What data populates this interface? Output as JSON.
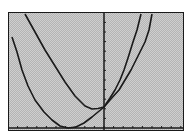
{
  "window": {
    "title": "Graph screen"
  },
  "chart_data": {
    "type": "line",
    "title": "",
    "xlabel": "",
    "ylabel": "",
    "grid": false,
    "axes": {
      "x_axis_pixel_y": 128,
      "y_axis_pixel_x": 104,
      "x_ticks_count": 18,
      "y_ticks_count": 10
    },
    "series": [
      {
        "name": "curve-1",
        "shape": "parabola opening upward (wider, higher vertex)",
        "points_px": [
          [
            25,
            14
          ],
          [
            35,
            32
          ],
          [
            45,
            50
          ],
          [
            55,
            66
          ],
          [
            65,
            82
          ],
          [
            75,
            96
          ],
          [
            85,
            106
          ],
          [
            92,
            109
          ],
          [
            98,
            108.5
          ],
          [
            104,
            107
          ],
          [
            110,
            98
          ],
          [
            115,
            90
          ],
          [
            120,
            80
          ],
          [
            124,
            70
          ],
          [
            128,
            58
          ],
          [
            133,
            42
          ],
          [
            137,
            30
          ],
          [
            141,
            14
          ]
        ]
      },
      {
        "name": "curve-2",
        "shape": "parabola opening upward (vertex on x-axis)",
        "points_px": [
          [
            12,
            37
          ],
          [
            17,
            52
          ],
          [
            22,
            70
          ],
          [
            28,
            86
          ],
          [
            35,
            100
          ],
          [
            44,
            112
          ],
          [
            52,
            120
          ],
          [
            60,
            126
          ],
          [
            68,
            128
          ],
          [
            76,
            127
          ],
          [
            84,
            123
          ],
          [
            92,
            117
          ],
          [
            98,
            112
          ],
          [
            104,
            107
          ],
          [
            110,
            100
          ],
          [
            119,
            90
          ],
          [
            125,
            80
          ],
          [
            131,
            70
          ],
          [
            137,
            58
          ],
          [
            145,
            42
          ],
          [
            149,
            30
          ],
          [
            152,
            14
          ]
        ]
      }
    ],
    "intersection_px": [
      104,
      107
    ],
    "line_color": "#1a1a1a",
    "background_color": "#c8c8c8"
  }
}
